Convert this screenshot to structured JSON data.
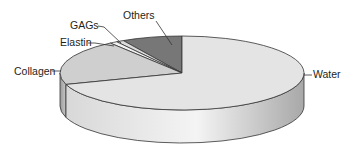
{
  "chart_data": {
    "type": "pie",
    "style": "3d",
    "title": "",
    "categories": [
      "Water",
      "Collagen",
      "Elastin",
      "GAGs",
      "Others"
    ],
    "values": [
      70,
      20,
      1,
      1,
      8
    ],
    "unit": "%",
    "legend": "none (leader-line labels)",
    "colors": {
      "Water": "#e4e4e4",
      "Collagen": "#cfcfcf",
      "Elastin": "#f2f2f2",
      "GAGs": "#dadada",
      "Others": "#777777"
    }
  },
  "labels": {
    "water": "Water",
    "collagen": "Collagen",
    "elastin": "Elastin",
    "gags": "GAGs",
    "others": "Others"
  }
}
